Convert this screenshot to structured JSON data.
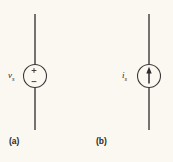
{
  "figure": {
    "background_color": "#faf8f1",
    "stroke_color": "#3a3a3a",
    "panels": [
      {
        "caption": "(a)",
        "symbol": "voltage-source",
        "label_main": "v",
        "label_sub": "s",
        "polarity_plus": "+",
        "polarity_minus": "−",
        "wire_x": 35,
        "wire_top": 14,
        "wire_bottom": 130,
        "circle_cx": 35,
        "circle_cy": 76,
        "circle_r": 11.5
      },
      {
        "caption": "(b)",
        "symbol": "current-source",
        "label_main": "i",
        "label_sub": "s",
        "arrow_direction": "up",
        "wire_x": 149,
        "wire_top": 14,
        "wire_bottom": 130,
        "circle_cx": 149,
        "circle_cy": 76,
        "circle_r": 11.5
      }
    ]
  }
}
